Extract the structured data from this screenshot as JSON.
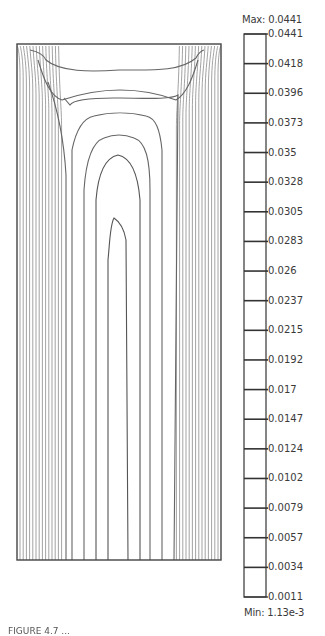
{
  "chart_data": {
    "type": "contour",
    "title": "",
    "xlabel": "",
    "ylabel": "",
    "colorbar": {
      "max_label": "Max: 0.0441",
      "min_label": "Min: 1.13e-3",
      "max": 0.0441,
      "min": 0.00113,
      "ticks": [
        "0.0441",
        "0.0418",
        "0.0396",
        "0.0373",
        "0.035",
        "0.0328",
        "0.0305",
        "0.0283",
        "0.026",
        "0.0237",
        "0.0215",
        "0.0192",
        "0.017",
        "0.0147",
        "0.0124",
        "0.0102",
        "0.0079",
        "0.0057",
        "0.0034",
        "0.0011"
      ],
      "levels": [
        0.0441,
        0.0418,
        0.0396,
        0.0373,
        0.035,
        0.0328,
        0.0305,
        0.0283,
        0.026,
        0.0237,
        0.0215,
        0.0192,
        0.017,
        0.0147,
        0.0124,
        0.0102,
        0.0079,
        0.0057,
        0.0034,
        0.0011
      ]
    },
    "grid": false,
    "legend_position": "right"
  },
  "caption": "FIGURE 4.7 ..."
}
